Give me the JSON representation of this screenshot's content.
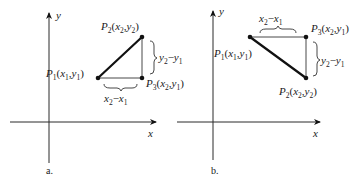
{
  "figure": {
    "panels": [
      {
        "id": "a",
        "caption": "a.",
        "axis_labels": {
          "x": "x",
          "y": "y"
        },
        "points": {
          "P1": {
            "name": "P",
            "sub": "1",
            "coords": [
              "x",
              "1",
              "y",
              "1"
            ]
          },
          "P2": {
            "name": "P",
            "sub": "2",
            "coords": [
              "x",
              "2",
              "y",
              "2"
            ]
          },
          "P3": {
            "name": "P",
            "sub": "3",
            "coords": [
              "x",
              "2",
              "y",
              "1"
            ]
          }
        },
        "horizontal_label": {
          "a": "x",
          "a_sub": "2",
          "op": "−",
          "b": "x",
          "b_sub": "1"
        },
        "vertical_label": {
          "a": "y",
          "a_sub": "2",
          "op": "−",
          "b": "y",
          "b_sub": "1"
        }
      },
      {
        "id": "b",
        "caption": "b.",
        "axis_labels": {
          "x": "x",
          "y": "y"
        },
        "points": {
          "P1": {
            "name": "P",
            "sub": "1",
            "coords": [
              "x",
              "1",
              "y",
              "1"
            ]
          },
          "P2": {
            "name": "P",
            "sub": "2",
            "coords": [
              "x",
              "2",
              "y",
              "2"
            ]
          },
          "P3": {
            "name": "P",
            "sub": "3",
            "coords": [
              "x",
              "2",
              "y",
              "1"
            ]
          }
        },
        "horizontal_label": {
          "a": "x",
          "a_sub": "2",
          "op": "−",
          "b": "x",
          "b_sub": "1"
        },
        "vertical_label": {
          "a": "y",
          "a_sub": "2",
          "op": "−",
          "b": "y",
          "b_sub": "1"
        }
      }
    ]
  }
}
